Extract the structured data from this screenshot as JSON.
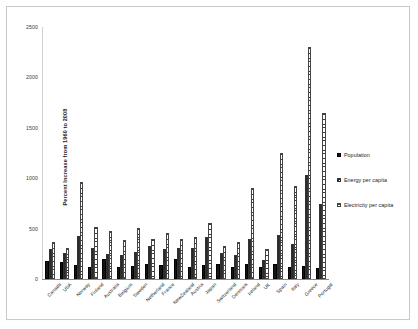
{
  "chart_data": {
    "type": "bar",
    "title": "",
    "xlabel": "",
    "ylabel": "Percent Increase from 1960 to 2008",
    "ylim": [
      0,
      2500
    ],
    "yticks": [
      2500,
      2000,
      1500,
      1000,
      500,
      0
    ],
    "ytick_labels": [
      "2500",
      "2000",
      "1500",
      "1000",
      "500",
      "0"
    ],
    "grid": false,
    "legend_position": "right",
    "categories": [
      "Canada",
      "USA",
      "Norway",
      "Finland",
      "Australia",
      "Belgium",
      "Sweden",
      "Netherland",
      "France",
      "NewZealand",
      "Austria",
      "Japan",
      "Switzerland",
      "Denmark",
      "Ireland",
      "UK",
      "Spain",
      "Italy",
      "Greece",
      "Portugal"
    ],
    "series": [
      {
        "name": "Population",
        "values": [
          175,
          165,
          140,
          120,
          200,
          120,
          125,
          150,
          140,
          200,
          115,
          135,
          150,
          115,
          145,
          115,
          145,
          115,
          130,
          110
        ]
      },
      {
        "name": "Energy per capita",
        "values": [
          300,
          255,
          430,
          310,
          250,
          235,
          270,
          330,
          300,
          305,
          310,
          420,
          255,
          235,
          400,
          185,
          440,
          350,
          1030,
          740
        ]
      },
      {
        "name": "Electricity per capita",
        "values": [
          370,
          310,
          960,
          520,
          480,
          390,
          510,
          400,
          460,
          400,
          420,
          560,
          330,
          370,
          900,
          300,
          1250,
          920,
          2300,
          1650
        ]
      }
    ]
  },
  "legend": {
    "entries": [
      {
        "label": "Population",
        "key": "solid-black"
      },
      {
        "label": "Energy per capita",
        "key": "cross-hatch"
      },
      {
        "label": "Electricity per capita",
        "key": "horizontal-stripe"
      }
    ]
  }
}
